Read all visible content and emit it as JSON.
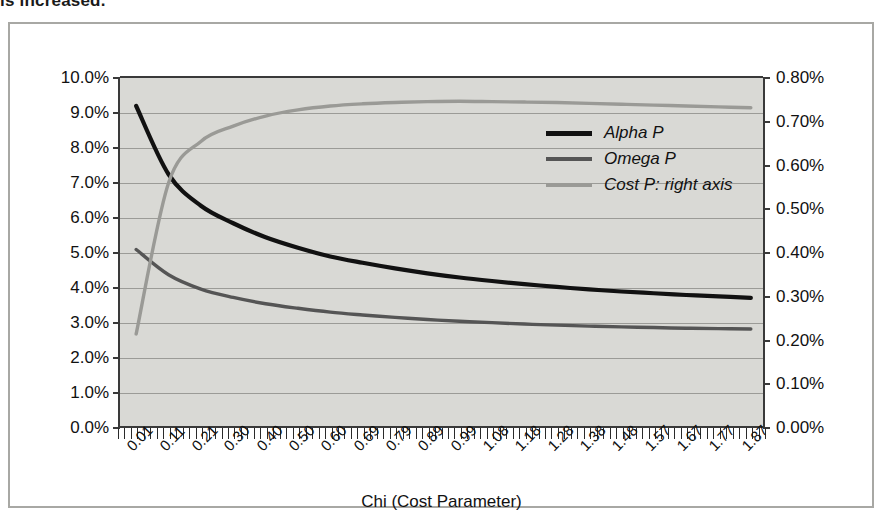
{
  "caption_fragment": "is increased.",
  "axis_title_x": "Chi (Cost Parameter)",
  "legend": [
    {
      "label": "Alpha P",
      "color": "#111111",
      "key": "alpha"
    },
    {
      "label": "Omega P",
      "color": "#555555",
      "key": "omega"
    },
    {
      "label": "Cost P: right axis",
      "color": "#9a9a96",
      "key": "cost"
    }
  ],
  "chart_data": {
    "type": "line",
    "title": "",
    "xlabel": "Chi (Cost Parameter)",
    "ylabel": "",
    "ylabel_right": "",
    "grid": true,
    "legend_position": "inside-right-top",
    "plot_background": "#d9d9d5",
    "x": [
      0.01,
      0.11,
      0.21,
      0.3,
      0.4,
      0.5,
      0.6,
      0.69,
      0.79,
      0.89,
      0.99,
      1.08,
      1.18,
      1.28,
      1.38,
      1.48,
      1.57,
      1.67,
      1.77,
      1.87
    ],
    "xtick_labels": [
      "0.01",
      "0.11",
      "0.21",
      "0.30",
      "0.40",
      "0.50",
      "0.60",
      "0.69",
      "0.79",
      "0.89",
      "0.99",
      "1.08",
      "1.18",
      "1.28",
      "1.38",
      "1.48",
      "1.57",
      "1.67",
      "1.77",
      "1.87"
    ],
    "ylim_left": [
      0.0,
      10.0
    ],
    "ytick_labels_left": [
      "0.0%",
      "1.0%",
      "2.0%",
      "3.0%",
      "4.0%",
      "5.0%",
      "6.0%",
      "7.0%",
      "8.0%",
      "9.0%",
      "10.0%"
    ],
    "ytick_values_left": [
      0.0,
      1.0,
      2.0,
      3.0,
      4.0,
      5.0,
      6.0,
      7.0,
      8.0,
      9.0,
      10.0
    ],
    "ylim_right": [
      0.0,
      0.8
    ],
    "ytick_labels_right": [
      "0.00%",
      "0.10%",
      "0.20%",
      "0.30%",
      "0.40%",
      "0.50%",
      "0.60%",
      "0.70%",
      "0.80%"
    ],
    "ytick_values_right": [
      0.0,
      0.1,
      0.2,
      0.3,
      0.4,
      0.5,
      0.6,
      0.7,
      0.8
    ],
    "series": [
      {
        "name": "Alpha P",
        "axis": "left",
        "color": "#111111",
        "values": [
          9.2,
          7.25,
          6.35,
          5.85,
          5.45,
          5.15,
          4.9,
          4.72,
          4.56,
          4.42,
          4.3,
          4.2,
          4.11,
          4.03,
          3.96,
          3.9,
          3.85,
          3.8,
          3.76,
          3.72
        ]
      },
      {
        "name": "Omega P",
        "axis": "left",
        "color": "#555555",
        "values": [
          5.1,
          4.38,
          3.97,
          3.73,
          3.55,
          3.42,
          3.31,
          3.23,
          3.16,
          3.1,
          3.05,
          3.01,
          2.97,
          2.94,
          2.91,
          2.89,
          2.87,
          2.85,
          2.84,
          2.83
        ]
      },
      {
        "name": "Cost P: right axis",
        "axis": "right",
        "color": "#9a9a96",
        "values": [
          0.215,
          0.56,
          0.655,
          0.69,
          0.713,
          0.727,
          0.736,
          0.741,
          0.744,
          0.746,
          0.747,
          0.746,
          0.745,
          0.744,
          0.742,
          0.74,
          0.738,
          0.736,
          0.734,
          0.732
        ]
      }
    ]
  }
}
